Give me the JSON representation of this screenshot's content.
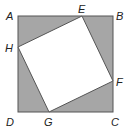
{
  "diagram": {
    "type": "geometry",
    "colors": {
      "shade": "#a6a6a6",
      "stroke": "#555555",
      "inner_fill": "#ffffff",
      "label": "#222222"
    },
    "outer_square": {
      "label": "ABCD",
      "vertices": {
        "A": [
          18,
          16
        ],
        "B": [
          113,
          16
        ],
        "C": [
          113,
          112
        ],
        "D": [
          18,
          112
        ]
      }
    },
    "inner_square": {
      "label": "EFGH",
      "vertices": {
        "E": [
          82,
          16
        ],
        "F": [
          113,
          81
        ],
        "G": [
          49,
          112
        ],
        "H": [
          18,
          47
        ]
      }
    },
    "labels": {
      "A": "A",
      "B": "B",
      "C": "C",
      "D": "D",
      "E": "E",
      "F": "F",
      "G": "G",
      "H": "H"
    }
  }
}
